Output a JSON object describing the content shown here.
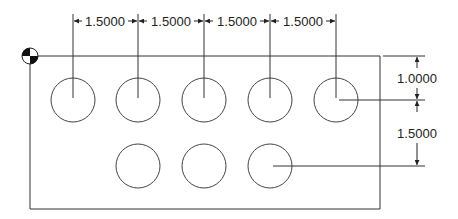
{
  "drawing": {
    "type": "hole pattern ordinate/chain dimension drawing",
    "datum_symbol": "datum-origin-target",
    "colors": {
      "line": "#333333",
      "text": "#222222",
      "background": "#ffffff"
    },
    "horizontal_dimensions": [
      {
        "label": "1.5000"
      },
      {
        "label": "1.5000"
      },
      {
        "label": "1.5000"
      },
      {
        "label": "1.5000"
      }
    ],
    "vertical_dimensions": [
      {
        "label": "1.0000"
      },
      {
        "label": "1.5000"
      }
    ],
    "holes": {
      "top_row_count": 5,
      "bottom_row_count": 3
    }
  }
}
